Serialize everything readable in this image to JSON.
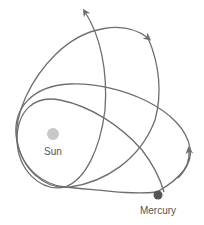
{
  "diagram": {
    "labels": {
      "sun": "Sun",
      "planet": "Mercury"
    },
    "colors": {
      "orbit": "#6e6e6e",
      "sun": "#c8c8c8",
      "planet": "#555555",
      "text": "#555555"
    },
    "orbits": [
      {
        "name": "orbit-1",
        "direction": "counterclockwise",
        "arrow": "right"
      },
      {
        "name": "orbit-2",
        "direction": "counterclockwise",
        "arrow": "top-right"
      },
      {
        "name": "orbit-3",
        "direction": "counterclockwise",
        "arrow": "top"
      }
    ]
  }
}
